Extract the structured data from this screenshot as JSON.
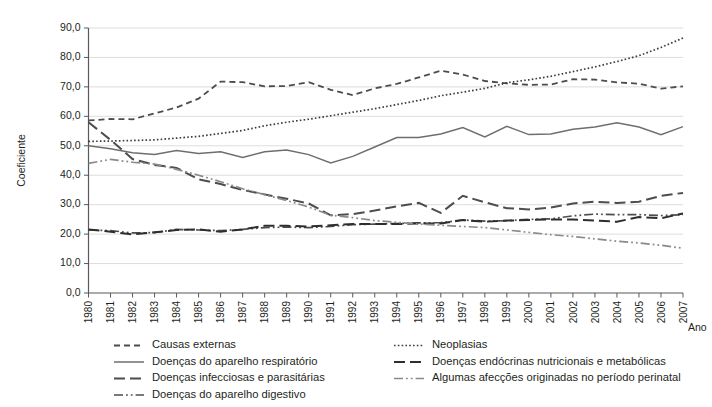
{
  "chart_data": {
    "type": "line",
    "title": "",
    "xlabel": "Ano",
    "ylabel": "Coeficiente",
    "ylim": [
      0,
      90
    ],
    "ytick_labels": [
      "0,0",
      "10,0",
      "20,0",
      "30,0",
      "40,0",
      "50,0",
      "60,0",
      "70,0",
      "80,0",
      "90,0"
    ],
    "ytick_values": [
      0,
      10,
      20,
      30,
      40,
      50,
      60,
      70,
      80,
      90
    ],
    "grid": "horizontal",
    "legend_position": "bottom",
    "categories": [
      "1980",
      "1981",
      "1982",
      "1983",
      "1984",
      "1985",
      "1986",
      "1987",
      "1988",
      "1989",
      "1990",
      "1991",
      "1992",
      "1993",
      "1994",
      "1995",
      "1996",
      "1997",
      "1998",
      "1999",
      "2000",
      "2001",
      "2002",
      "2003",
      "2004",
      "2005",
      "2006",
      "2007"
    ],
    "series": [
      {
        "name": "Causas externas",
        "style": "dashed",
        "color": "#4d4d4d",
        "values": [
          58.6,
          59.1,
          59.0,
          61.0,
          63.0,
          66.0,
          71.8,
          71.6,
          70.2,
          70.3,
          71.6,
          69.0,
          67.2,
          69.5,
          71.0,
          73.2,
          75.5,
          74.2,
          72.0,
          71.2,
          70.7,
          70.8,
          72.6,
          72.5,
          71.5,
          71.1,
          69.4,
          70.2
        ]
      },
      {
        "name": "Doenças do aparelho respiratório",
        "style": "solid",
        "color": "#6e6e6e",
        "values": [
          50.0,
          49.0,
          47.6,
          47.0,
          48.4,
          47.4,
          48.0,
          46.0,
          48.0,
          48.6,
          47.0,
          44.2,
          46.4,
          49.6,
          52.8,
          52.8,
          54.0,
          56.2,
          53.0,
          56.6,
          53.8,
          54.0,
          55.6,
          56.4,
          57.8,
          56.4,
          53.8,
          56.5
        ]
      },
      {
        "name": "Doenças infecciosas e parasitárias",
        "style": "longdash",
        "color": "#4d4d4d",
        "values": [
          58.0,
          52.0,
          45.5,
          43.5,
          42.5,
          38.6,
          37.0,
          35.0,
          33.5,
          32.0,
          30.4,
          26.4,
          26.8,
          28.0,
          29.4,
          30.6,
          27.2,
          33.0,
          30.8,
          28.8,
          28.4,
          29.0,
          30.4,
          31.0,
          30.6,
          31.0,
          33.0,
          34.0
        ]
      },
      {
        "name": "Doenças do aparelho digestivo",
        "style": "dashdotdot",
        "color": "#4d4d4d",
        "values": [
          21.4,
          21.2,
          20.4,
          20.5,
          21.6,
          21.4,
          21.2,
          21.6,
          22.2,
          22.4,
          22.2,
          22.6,
          23.2,
          23.4,
          23.6,
          23.8,
          23.9,
          24.8,
          24.4,
          24.6,
          25.0,
          25.2,
          26.2,
          26.8,
          26.6,
          26.6,
          26.3,
          26.6
        ]
      },
      {
        "name": "Neoplasias",
        "style": "dotted",
        "color": "#3d3d3d",
        "values": [
          51.5,
          51.6,
          51.8,
          52.0,
          52.6,
          53.2,
          54.2,
          55.2,
          56.8,
          58.0,
          59.0,
          60.2,
          61.4,
          62.6,
          64.0,
          65.4,
          67.0,
          68.2,
          69.5,
          71.4,
          72.4,
          73.6,
          75.2,
          76.8,
          78.6,
          80.6,
          83.4,
          86.6
        ]
      },
      {
        "name": "Doenças endócrinas nutricionais e metabólicas",
        "style": "longdash",
        "color": "#2e2e2e",
        "values": [
          21.6,
          20.8,
          19.9,
          20.6,
          21.4,
          21.6,
          20.8,
          21.6,
          22.8,
          22.8,
          22.6,
          23.0,
          23.4,
          23.4,
          23.4,
          23.6,
          23.6,
          24.8,
          24.2,
          24.6,
          24.8,
          25.0,
          25.0,
          24.6,
          24.2,
          25.8,
          25.4,
          27.0
        ]
      },
      {
        "name": "Algumas afecções originadas no período perinatal",
        "style": "dashdotdot",
        "color": "#8a8a8a",
        "values": [
          44.0,
          45.4,
          44.4,
          43.8,
          42.0,
          40.0,
          37.8,
          35.4,
          33.4,
          31.4,
          29.2,
          26.4,
          25.6,
          24.6,
          24.0,
          23.4,
          23.0,
          22.6,
          22.2,
          21.4,
          20.6,
          19.8,
          19.2,
          18.4,
          17.6,
          17.0,
          16.2,
          15.2
        ]
      }
    ]
  },
  "legend": {
    "column_left": [
      {
        "label": "Causas externas",
        "style": "dashed",
        "color": "#4d4d4d"
      },
      {
        "label": "Doenças do aparelho respiratório",
        "style": "solid",
        "color": "#6e6e6e"
      },
      {
        "label": "Doenças infecciosas e parasitárias",
        "style": "longdash",
        "color": "#4d4d4d"
      },
      {
        "label": "Doenças do aparelho digestivo",
        "style": "dashdotdot",
        "color": "#4d4d4d"
      }
    ],
    "column_right": [
      {
        "label": "Neoplasias",
        "style": "dotted",
        "color": "#3d3d3d"
      },
      {
        "label": "Doenças endócrinas nutricionais e metabólicas",
        "style": "longdash",
        "color": "#2e2e2e"
      },
      {
        "label": "Algumas afecções originadas no período perinatal",
        "style": "dashdotdot",
        "color": "#8a8a8a"
      }
    ]
  }
}
